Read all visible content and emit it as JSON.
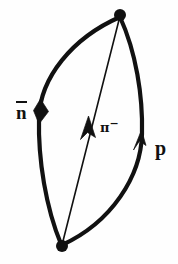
{
  "figure": {
    "kind": "feynman-diagram",
    "background_color": "#fefefe",
    "stroke_color": "#111111",
    "canvas": {
      "width": 178,
      "height": 264
    }
  },
  "labels": {
    "antineutron": {
      "glyph": "n",
      "overbar": true,
      "text": "n"
    },
    "pion": {
      "base": "π",
      "charge": "−",
      "text": "π−"
    },
    "proton": {
      "text": "p"
    }
  },
  "vertices": [
    {
      "name": "top-vertex",
      "x": 120,
      "y": 15,
      "radius": 6
    },
    {
      "name": "bottom-vertex",
      "x": 62,
      "y": 246,
      "radius": 6
    }
  ],
  "edges": [
    {
      "name": "antineutron-arc",
      "particle": "n-bar",
      "style": "thick-curve",
      "bulge": "left",
      "arrow_direction": "down",
      "arrow_at": {
        "x": 41,
        "y": 112
      },
      "stroke_width": 4.2,
      "path": "M 120 17 C 72 38 40 78 39 118 C 38 160 46 208 61 244"
    },
    {
      "name": "pion-line",
      "particle": "pi-minus",
      "style": "thin-straight",
      "arrow_direction": "up",
      "arrow_at": {
        "x": 88,
        "y": 128
      },
      "stroke_width": 1.6,
      "path": "M 62 245 L 120 16"
    },
    {
      "name": "proton-arc",
      "particle": "p",
      "style": "thick-curve",
      "bulge": "right",
      "arrow_direction": "up",
      "arrow_at": {
        "x": 140,
        "y": 143
      },
      "stroke_width": 4.2,
      "path": "M 120 17 C 136 52 143 96 142 134 C 141 176 112 222 62 245"
    }
  ]
}
